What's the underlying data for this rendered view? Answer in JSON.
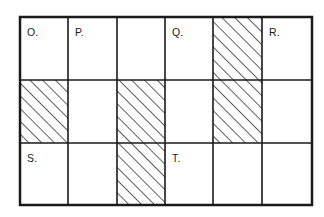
{
  "diagram": {
    "type": "grid-shading-diagram",
    "background_color": "#ffffff",
    "line_color": "#1a1a1a",
    "hatch_color": "#1a1a1a",
    "text_color": "#1a1a1a",
    "outer_border": {
      "x": 20,
      "y": 17,
      "width": 292,
      "height": 188,
      "stroke_width": 2.5
    },
    "grid": {
      "columns": 6,
      "rows": 3,
      "column_edges_px": [
        20,
        68,
        117,
        165,
        213,
        262,
        312
      ],
      "row_edges_px": [
        17,
        80,
        143,
        205
      ],
      "interior_stroke_width": 1.6
    },
    "hatch": {
      "direction": "bottom-left-to-top-right",
      "spacing_px": 9,
      "stroke_width": 1.4
    },
    "cells": [
      {
        "row": 1,
        "col": 1,
        "label": "O.",
        "hatched": false
      },
      {
        "row": 1,
        "col": 2,
        "label": "P.",
        "hatched": false
      },
      {
        "row": 1,
        "col": 3,
        "label": "",
        "hatched": false
      },
      {
        "row": 1,
        "col": 4,
        "label": "Q.",
        "hatched": false
      },
      {
        "row": 1,
        "col": 5,
        "label": "",
        "hatched": true
      },
      {
        "row": 1,
        "col": 6,
        "label": "R.",
        "hatched": false
      },
      {
        "row": 2,
        "col": 1,
        "label": "",
        "hatched": true
      },
      {
        "row": 2,
        "col": 2,
        "label": "",
        "hatched": false
      },
      {
        "row": 2,
        "col": 3,
        "label": "",
        "hatched": true
      },
      {
        "row": 2,
        "col": 4,
        "label": "",
        "hatched": false
      },
      {
        "row": 2,
        "col": 5,
        "label": "",
        "hatched": true
      },
      {
        "row": 2,
        "col": 6,
        "label": "",
        "hatched": false
      },
      {
        "row": 3,
        "col": 1,
        "label": "S.",
        "hatched": false
      },
      {
        "row": 3,
        "col": 2,
        "label": "",
        "hatched": false
      },
      {
        "row": 3,
        "col": 3,
        "label": "",
        "hatched": true
      },
      {
        "row": 3,
        "col": 4,
        "label": "T.",
        "hatched": false
      },
      {
        "row": 3,
        "col": 5,
        "label": "",
        "hatched": false
      },
      {
        "row": 3,
        "col": 6,
        "label": "",
        "hatched": false
      }
    ],
    "labels": [
      {
        "text": "O.",
        "x": 27,
        "y": 27
      },
      {
        "text": "P.",
        "x": 75,
        "y": 27
      },
      {
        "text": "Q.",
        "x": 172,
        "y": 27
      },
      {
        "text": "R.",
        "x": 269,
        "y": 27
      },
      {
        "text": "S.",
        "x": 27,
        "y": 153
      },
      {
        "text": "T.",
        "x": 172,
        "y": 153
      }
    ]
  }
}
